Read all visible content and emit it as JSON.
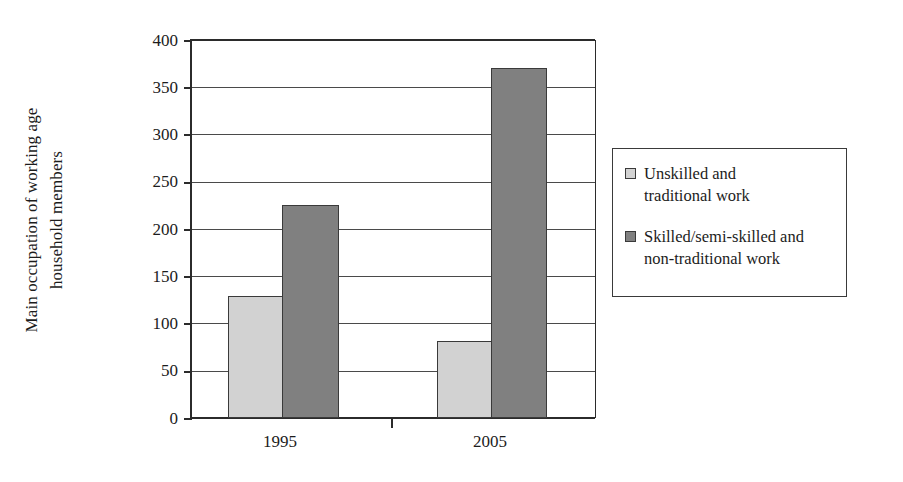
{
  "chart_data": {
    "type": "bar",
    "title": "",
    "subtitle": "",
    "xlabel": "",
    "ylabel": "Main occupation of working age household members",
    "ylabel_lines": [
      "Main occupation of working age",
      "household members"
    ],
    "categories": [
      "1995",
      "2005"
    ],
    "series": [
      {
        "name": "Unskilled and traditional work",
        "name_lines": [
          "Unskilled and",
          "traditional work"
        ],
        "color": "#d2d2d2",
        "values": [
          129,
          82
        ]
      },
      {
        "name": "Skilled/semi-skilled and non-traditional work",
        "name_lines": [
          "Skilled/semi-skilled and",
          "non-traditional work"
        ],
        "color": "#808080",
        "values": [
          225,
          370
        ]
      }
    ],
    "ylim": [
      0,
      400
    ],
    "ytick_values": [
      400,
      350,
      300,
      250,
      200,
      150,
      100,
      50,
      0
    ],
    "ytick_labels": [
      "400",
      "350",
      "300",
      "250",
      "200",
      "150",
      "100",
      "50",
      "0"
    ],
    "grid": true,
    "grid_axis": "y",
    "legend_position": "right"
  },
  "legend": {
    "entries": [
      {
        "label_line1": "Unskilled and",
        "label_line2": "traditional work",
        "swatch": "light"
      },
      {
        "label_line1": "Skilled/semi-skilled and",
        "label_line2": "non-traditional work",
        "swatch": "dark"
      }
    ]
  },
  "axis": {
    "y_title_line1": "Main occupation of working age",
    "y_title_line2": "household members",
    "x_labels": [
      "1995",
      "2005"
    ],
    "y_labels": [
      "400",
      "350",
      "300",
      "250",
      "200",
      "150",
      "100",
      "50",
      "0"
    ]
  },
  "colors": {
    "light_series": "#d2d2d2",
    "dark_series": "#808080",
    "axis": "#2b2b2b",
    "grid": "#4a4a4a",
    "background": "#ffffff"
  }
}
